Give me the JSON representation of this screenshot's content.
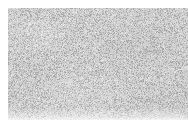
{
  "image": {
    "kind": "natural-texture-photograph",
    "subject": "fine-grained speckled gray surface (concrete / granite / stucco)",
    "caption": "",
    "width": 188,
    "height": 131
  },
  "canvas": {
    "background_color": "#ffffff"
  },
  "plate": {
    "left": 8,
    "top": 8,
    "width": 180,
    "height": 112,
    "base_color": "#d2d2d2"
  },
  "texture": {
    "pattern": "uniform per-pixel grain",
    "grain_scale_px": 1,
    "mean_gray": "#d0d0d0",
    "min_gray": "#a8a8a8",
    "max_gray": "#f0f0f0",
    "noise_amplitude": 34,
    "dark_speck_ratio": 0.16,
    "dark_speck_color": "#9a9a9a",
    "mottle_opacity": 0.3,
    "seed": 20240517
  },
  "margins": {
    "left_px": 8,
    "top_px": 8,
    "right_px": 0,
    "bottom_px": 11,
    "color": "#ffffff"
  },
  "overlays": {
    "text": [],
    "labels": [],
    "annotations": []
  }
}
